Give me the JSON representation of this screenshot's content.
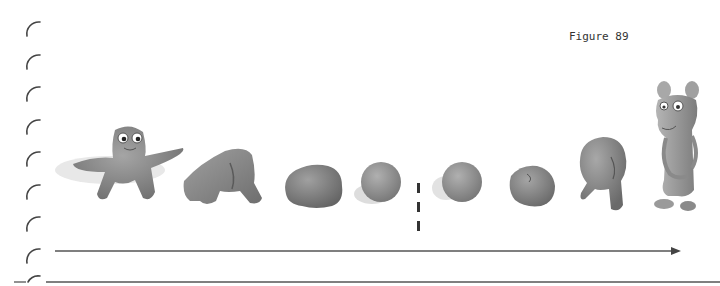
{
  "figure": {
    "label": "Figure 89"
  },
  "sequence": {
    "description": "Clay figure transformation sequence",
    "before_divider": [
      {
        "name": "star-shaped-clay-figure",
        "kind": "figure"
      },
      {
        "name": "collapsed-clay-figure",
        "kind": "transition"
      },
      {
        "name": "clay-lump",
        "kind": "transition"
      },
      {
        "name": "clay-ball",
        "kind": "ball"
      }
    ],
    "after_divider": [
      {
        "name": "clay-ball",
        "kind": "ball"
      },
      {
        "name": "clay-lump",
        "kind": "transition"
      },
      {
        "name": "partially-formed-clay-figure",
        "kind": "transition"
      },
      {
        "name": "mouse-like-clay-figure",
        "kind": "figure"
      }
    ]
  },
  "colors": {
    "clay": "#8a8a8a",
    "line": "#555555",
    "binding": "#444444"
  }
}
